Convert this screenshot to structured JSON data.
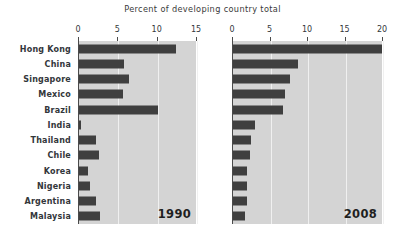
{
  "chart_data": {
    "type": "bar",
    "title": "Percent of developing country total",
    "xlabel": "",
    "ylabel": "",
    "orientation": "horizontal",
    "grid": true,
    "legend": false,
    "categories": [
      "Hong Kong",
      "China",
      "Singapore",
      "Mexico",
      "Brazil",
      "India",
      "Thailand",
      "Chile",
      "Korea",
      "Nigeria",
      "Argentina",
      "Malaysia"
    ],
    "panels": [
      {
        "name": "1990",
        "label": "1990",
        "xlim": [
          0,
          15
        ],
        "ticks": [
          0,
          5,
          10,
          15
        ],
        "tick_labels": [
          "0",
          "5",
          "10",
          "15"
        ],
        "values": [
          12.3,
          5.7,
          6.4,
          5.6,
          10.1,
          0.3,
          2.2,
          2.6,
          1.2,
          1.4,
          2.2,
          2.7
        ]
      },
      {
        "name": "2008",
        "label": "2008",
        "xlim": [
          0,
          20
        ],
        "ticks": [
          0,
          5,
          10,
          15,
          20
        ],
        "tick_labels": [
          "0",
          "5",
          "10",
          "15",
          "20"
        ],
        "values": [
          19.8,
          8.7,
          7.6,
          6.9,
          6.7,
          2.9,
          2.4,
          2.2,
          1.9,
          1.8,
          1.8,
          1.6
        ]
      }
    ],
    "colors": {
      "bar": "#3f3f3f",
      "panel_background": "#d4d4d4",
      "gridline": "#f0f0f0",
      "axis": "#4a4a4a",
      "text": "#33373b",
      "figure_background": "#ffffff"
    }
  }
}
